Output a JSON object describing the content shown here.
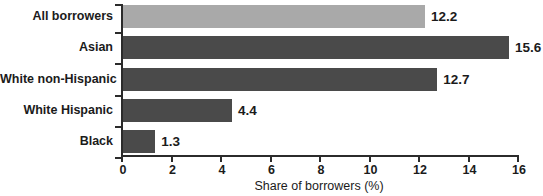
{
  "chart_data": {
    "type": "bar",
    "orientation": "horizontal",
    "title": "",
    "xlabel": "Share of borrowers (%)",
    "ylabel": "",
    "categories": [
      "All borrowers",
      "Asian",
      "White non-Hispanic",
      "White Hispanic",
      "Black"
    ],
    "values": [
      12.2,
      15.6,
      12.7,
      4.4,
      1.3
    ],
    "value_labels": [
      "12.2",
      "15.6",
      "12.7",
      "4.4",
      "1.3"
    ],
    "bar_colors": [
      "#a9a9a9",
      "#4a4a4a",
      "#4a4a4a",
      "#4a4a4a",
      "#4a4a4a"
    ],
    "xlim": [
      0,
      16
    ],
    "xticks": [
      0,
      2,
      4,
      6,
      8,
      10,
      12,
      14,
      16
    ],
    "xtick_labels": [
      "0",
      "2",
      "4",
      "6",
      "8",
      "10",
      "12",
      "14",
      "16"
    ],
    "grid": false,
    "legend": null
  },
  "axis": {
    "title": "Share of borrowers (%)",
    "spine_color": "#2b2b2b"
  }
}
